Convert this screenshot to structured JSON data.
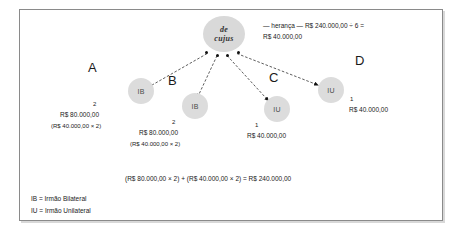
{
  "diagram": {
    "root": {
      "label_line1": "de",
      "label_line2": "cujus"
    },
    "heranca": {
      "line1": "— herança — R$ 240.000,00 ÷ 6 =",
      "line2": "R$ 40.000,00"
    },
    "heirs": [
      {
        "letter": "A",
        "type": "IB",
        "quota": "2",
        "amount": "R$ 80.000,00",
        "calc": "(R$ 40.000,00 × 2)"
      },
      {
        "letter": "B",
        "type": "IB",
        "quota": "2",
        "amount": "R$ 80.000,00",
        "calc": "(R$ 40.000,00 × 2)"
      },
      {
        "letter": "C",
        "type": "IU",
        "quota": "1",
        "amount": "R$ 40.000,00",
        "calc": ""
      },
      {
        "letter": "D",
        "type": "IU",
        "quota": "1",
        "amount": "R$ 40.000,00",
        "calc": ""
      }
    ],
    "total_line": "(R$ 80.000,00 × 2) + (R$ 40.000,00 × 2) = R$ 240.000,00",
    "legend": {
      "line1": "IB = Irmão Bilateral",
      "line2": "IU = Irmão Unilateral"
    },
    "colors": {
      "node_fill": "#dcdcdc",
      "border": "#8a8a8a",
      "text": "#1a1a1a",
      "dot": "#111111"
    }
  }
}
